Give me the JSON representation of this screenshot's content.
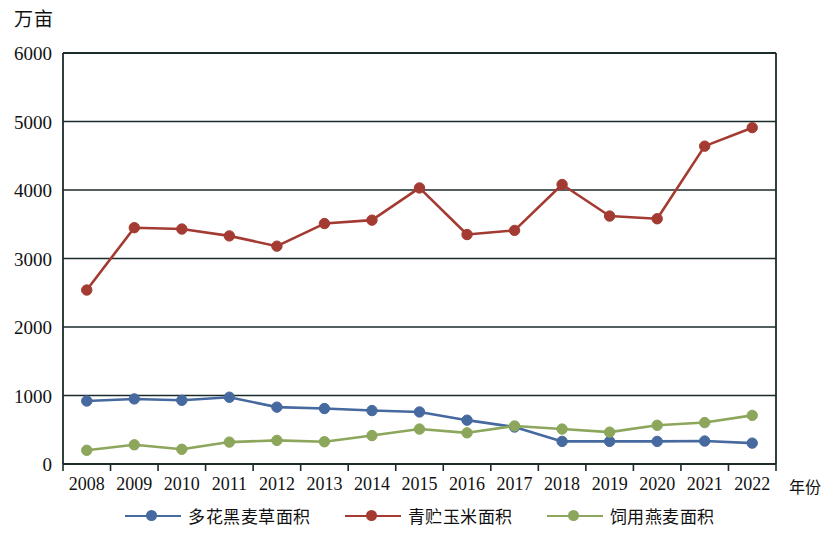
{
  "chart_data": {
    "type": "line",
    "title": "",
    "xlabel": "年份",
    "ylabel": "万亩",
    "x": [
      2008,
      2009,
      2010,
      2011,
      2012,
      2013,
      2014,
      2015,
      2016,
      2017,
      2018,
      2019,
      2020,
      2021,
      2022
    ],
    "categories": [
      "2008",
      "2009",
      "2010",
      "2011",
      "2012",
      "2013",
      "2014",
      "2015",
      "2016",
      "2017",
      "2018",
      "2019",
      "2020",
      "2021",
      "2022"
    ],
    "ylim": [
      0,
      6000
    ],
    "yticks": [
      0,
      1000,
      2000,
      3000,
      4000,
      5000,
      6000
    ],
    "ytick_labels": [
      "0",
      "1000",
      "2000",
      "3000",
      "4000",
      "5000",
      "6000"
    ],
    "grid": true,
    "legend_position": "bottom",
    "series": [
      {
        "name": "多花黑麦草面积",
        "color": "#46699f",
        "values": [
          920,
          950,
          930,
          975,
          830,
          810,
          780,
          760,
          640,
          540,
          330,
          330,
          330,
          335,
          305
        ]
      },
      {
        "name": "青贮玉米面积",
        "color": "#a33b32",
        "values": [
          2540,
          3450,
          3430,
          3330,
          3180,
          3510,
          3560,
          4030,
          3350,
          3410,
          4080,
          3620,
          3580,
          4640,
          4910
        ]
      },
      {
        "name": "饲用燕麦面积",
        "color": "#8ca65c",
        "values": [
          200,
          280,
          215,
          320,
          345,
          325,
          415,
          510,
          455,
          555,
          510,
          465,
          565,
          605,
          710
        ]
      }
    ]
  },
  "legend": {
    "items": [
      {
        "label": "多花黑麦草面积",
        "color": "#46699f"
      },
      {
        "label": "青贮玉米面积",
        "color": "#a33b32"
      },
      {
        "label": "饲用燕麦面积",
        "color": "#8ca65c"
      }
    ]
  },
  "axes": {
    "y_unit": "万亩",
    "x_title": "年份"
  }
}
